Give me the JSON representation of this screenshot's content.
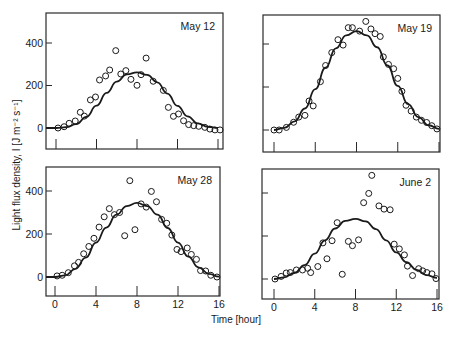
{
  "figure": {
    "ylabel": "Light flux density, I [J m⁻² s⁻¹]",
    "xlabel": "Time [hour]",
    "colors": {
      "ink": "#1a1a1a",
      "background": "#ffffff"
    }
  },
  "chart_data": [
    {
      "type": "scatter",
      "title": "May 12",
      "xlabel": "Time [hour]",
      "ylabel": "Light flux density, I [J m-2 s-1]",
      "xlim": [
        -1,
        16.5
      ],
      "ylim": [
        -100,
        520
      ],
      "xticks": [
        0,
        4,
        8,
        12,
        16
      ],
      "yticks": [
        0,
        200,
        400
      ],
      "show_xtick_labels": false,
      "show_ytick_labels": true,
      "grid": false,
      "series": [
        {
          "name": "measured",
          "kind": "scatter",
          "marker": "open-circle",
          "points": [
            [
              0.2,
              0
            ],
            [
              0.8,
              6
            ],
            [
              1.3,
              22
            ],
            [
              1.9,
              33
            ],
            [
              2.4,
              74
            ],
            [
              2.8,
              56
            ],
            [
              3.4,
              132
            ],
            [
              3.9,
              146
            ],
            [
              4.3,
              226
            ],
            [
              4.9,
              245
            ],
            [
              5.3,
              273
            ],
            [
              5.9,
              364
            ],
            [
              6.4,
              254
            ],
            [
              6.9,
              270
            ],
            [
              7.4,
              229
            ],
            [
              8.0,
              201
            ],
            [
              8.4,
              251
            ],
            [
              8.9,
              329
            ],
            [
              9.6,
              220
            ],
            [
              10.6,
              177
            ],
            [
              11.1,
              97
            ],
            [
              11.6,
              55
            ],
            [
              12.1,
              66
            ],
            [
              12.6,
              34
            ],
            [
              13.1,
              16
            ],
            [
              13.6,
              11
            ],
            [
              14.1,
              8
            ],
            [
              14.7,
              3
            ],
            [
              15.2,
              -5
            ],
            [
              15.7,
              -9
            ],
            [
              16.2,
              -9
            ]
          ]
        },
        {
          "name": "model",
          "kind": "line",
          "points": [
            [
              -1,
              0
            ],
            [
              0,
              0
            ],
            [
              1,
              4
            ],
            [
              2,
              18
            ],
            [
              3,
              52
            ],
            [
              4,
              105
            ],
            [
              5,
              165
            ],
            [
              6,
              218
            ],
            [
              7,
              252
            ],
            [
              8,
              262
            ],
            [
              9,
              250
            ],
            [
              10,
              215
            ],
            [
              11,
              162
            ],
            [
              12,
              104
            ],
            [
              13,
              55
            ],
            [
              14,
              22
            ],
            [
              15,
              6
            ],
            [
              16,
              0
            ]
          ]
        }
      ]
    },
    {
      "type": "scatter",
      "title": "May 19",
      "xlabel": "Time [hour]",
      "ylabel": "Light flux density, I [J m-2 s-1]",
      "xlim": [
        -1,
        16.5
      ],
      "ylim": [
        -100,
        520
      ],
      "xticks": [
        0,
        4,
        8,
        12,
        16
      ],
      "yticks": [
        0,
        200,
        400
      ],
      "show_xtick_labels": false,
      "show_ytick_labels": false,
      "grid": false,
      "series": [
        {
          "name": "measured",
          "kind": "scatter",
          "marker": "open-circle",
          "points": [
            [
              0,
              0
            ],
            [
              0.5,
              0
            ],
            [
              1.2,
              12
            ],
            [
              1.9,
              36
            ],
            [
              2.4,
              60
            ],
            [
              3.0,
              68
            ],
            [
              3.4,
              135
            ],
            [
              3.8,
              112
            ],
            [
              4.5,
              225
            ],
            [
              5.0,
              300
            ],
            [
              5.6,
              360
            ],
            [
              6.2,
              420
            ],
            [
              6.7,
              395
            ],
            [
              7.2,
              476
            ],
            [
              7.6,
              476
            ],
            [
              8.3,
              460
            ],
            [
              8.9,
              505
            ],
            [
              9.4,
              470
            ],
            [
              9.8,
              448
            ],
            [
              10.3,
              435
            ],
            [
              10.6,
              340
            ],
            [
              11.1,
              305
            ],
            [
              11.6,
              285
            ],
            [
              12.0,
              240
            ],
            [
              12.4,
              180
            ],
            [
              12.8,
              115
            ],
            [
              13.3,
              88
            ],
            [
              13.8,
              60
            ],
            [
              14.3,
              45
            ],
            [
              14.8,
              35
            ],
            [
              15.3,
              20
            ],
            [
              15.8,
              5
            ]
          ]
        },
        {
          "name": "model",
          "kind": "line",
          "points": [
            [
              0,
              0
            ],
            [
              1,
              10
            ],
            [
              2,
              40
            ],
            [
              3,
              100
            ],
            [
              4,
              190
            ],
            [
              5,
              290
            ],
            [
              6,
              380
            ],
            [
              7,
              440
            ],
            [
              8,
              460
            ],
            [
              9,
              440
            ],
            [
              10,
              385
            ],
            [
              11,
              300
            ],
            [
              12,
              205
            ],
            [
              13,
              120
            ],
            [
              14,
              60
            ],
            [
              15,
              22
            ],
            [
              16,
              5
            ]
          ]
        }
      ]
    },
    {
      "type": "scatter",
      "title": "May 28",
      "xlabel": "Time [hour]",
      "ylabel": "Light flux density, I [J m-2 s-1]",
      "xlim": [
        -1,
        16.5
      ],
      "ylim": [
        -100,
        520
      ],
      "xticks": [
        0,
        4,
        8,
        12,
        16
      ],
      "yticks": [
        0,
        200,
        400
      ],
      "show_xtick_labels": true,
      "show_ytick_labels": true,
      "grid": false,
      "series": [
        {
          "name": "measured",
          "kind": "scatter",
          "marker": "open-circle",
          "points": [
            [
              0.2,
              5
            ],
            [
              0.7,
              8
            ],
            [
              1.3,
              20
            ],
            [
              1.9,
              52
            ],
            [
              2.3,
              68
            ],
            [
              2.8,
              108
            ],
            [
              3.3,
              142
            ],
            [
              3.8,
              180
            ],
            [
              4.3,
              232
            ],
            [
              4.8,
              280
            ],
            [
              5.3,
              318
            ],
            [
              5.8,
              290
            ],
            [
              6.3,
              300
            ],
            [
              6.8,
              192
            ],
            [
              7.3,
              448
            ],
            [
              7.8,
              220
            ],
            [
              8.4,
              340
            ],
            [
              8.9,
              325
            ],
            [
              9.4,
              398
            ],
            [
              9.9,
              350
            ],
            [
              10.4,
              268
            ],
            [
              10.9,
              250
            ],
            [
              11.4,
              195
            ],
            [
              11.9,
              128
            ],
            [
              12.3,
              118
            ],
            [
              12.9,
              135
            ],
            [
              13.3,
              105
            ],
            [
              13.8,
              82
            ],
            [
              14.2,
              30
            ],
            [
              14.7,
              28
            ],
            [
              15.2,
              8
            ],
            [
              15.8,
              0
            ]
          ]
        },
        {
          "name": "model",
          "kind": "line",
          "points": [
            [
              -1,
              0
            ],
            [
              0,
              0
            ],
            [
              1,
              8
            ],
            [
              2,
              38
            ],
            [
              3,
              90
            ],
            [
              4,
              160
            ],
            [
              5,
              230
            ],
            [
              6,
              290
            ],
            [
              7,
              330
            ],
            [
              8,
              345
            ],
            [
              9,
              330
            ],
            [
              10,
              290
            ],
            [
              11,
              228
            ],
            [
              12,
              160
            ],
            [
              13,
              95
            ],
            [
              14,
              45
            ],
            [
              15,
              15
            ],
            [
              16,
              2
            ]
          ]
        }
      ]
    },
    {
      "type": "scatter",
      "title": "June 2",
      "xlabel": "Time [hour]",
      "ylabel": "Light flux density, I [J m-2 s-1]",
      "xlim": [
        -1,
        16.5
      ],
      "ylim": [
        -100,
        520
      ],
      "xticks": [
        0,
        4,
        8,
        12,
        16
      ],
      "yticks": [
        0,
        200,
        400
      ],
      "show_xtick_labels": true,
      "show_ytick_labels": false,
      "grid": false,
      "series": [
        {
          "name": "measured",
          "kind": "scatter",
          "marker": "open-circle",
          "points": [
            [
              0.1,
              0
            ],
            [
              0.7,
              12
            ],
            [
              1.2,
              28
            ],
            [
              1.6,
              30
            ],
            [
              2.2,
              42
            ],
            [
              2.8,
              42
            ],
            [
              3.3,
              50
            ],
            [
              3.6,
              30
            ],
            [
              4.3,
              58
            ],
            [
              4.8,
              168
            ],
            [
              5.2,
              94
            ],
            [
              5.7,
              178
            ],
            [
              6.2,
              262
            ],
            [
              6.7,
              22
            ],
            [
              7.3,
              175
            ],
            [
              7.7,
              155
            ],
            [
              8.3,
              182
            ],
            [
              8.8,
              355
            ],
            [
              9.3,
              398
            ],
            [
              9.6,
              482
            ],
            [
              10.3,
              340
            ],
            [
              10.8,
              325
            ],
            [
              11.4,
              322
            ],
            [
              11.8,
              162
            ],
            [
              12.3,
              140
            ],
            [
              12.8,
              112
            ],
            [
              13.1,
              60
            ],
            [
              13.6,
              16
            ],
            [
              14.2,
              48
            ],
            [
              14.6,
              38
            ],
            [
              15.0,
              30
            ],
            [
              15.5,
              24
            ],
            [
              15.9,
              2
            ]
          ]
        },
        {
          "name": "model",
          "kind": "line",
          "points": [
            [
              0,
              0
            ],
            [
              1,
              8
            ],
            [
              2,
              28
            ],
            [
              3,
              65
            ],
            [
              4,
              118
            ],
            [
              5,
              180
            ],
            [
              6,
              235
            ],
            [
              7,
              270
            ],
            [
              8,
              280
            ],
            [
              9,
              268
            ],
            [
              10,
              232
            ],
            [
              11,
              180
            ],
            [
              12,
              124
            ],
            [
              13,
              78
            ],
            [
              14,
              42
            ],
            [
              15,
              18
            ],
            [
              16,
              5
            ]
          ]
        }
      ]
    }
  ]
}
